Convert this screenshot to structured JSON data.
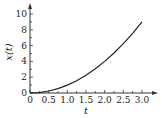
{
  "chart_data": {
    "type": "line",
    "title": "",
    "xlabel": "t",
    "ylabel": "x(t)",
    "xlim": [
      0,
      3.3
    ],
    "ylim": [
      0,
      11
    ],
    "x_ticks": [
      "0",
      "0.5",
      "1.0",
      "1.5",
      "2.0",
      "2.5",
      "3.0"
    ],
    "y_ticks": [
      "0",
      "2",
      "4",
      "6",
      "8",
      "10"
    ],
    "grid": false,
    "legend": null,
    "series": [
      {
        "name": "x(t)",
        "x": [
          0,
          0.25,
          0.5,
          0.75,
          1.0,
          1.25,
          1.5,
          1.75,
          2.0,
          2.25,
          2.5,
          2.75,
          3.0
        ],
        "y": [
          0,
          0.06,
          0.25,
          0.56,
          1.0,
          1.56,
          2.25,
          3.06,
          4.0,
          5.06,
          6.25,
          7.56,
          9.0
        ]
      }
    ]
  }
}
